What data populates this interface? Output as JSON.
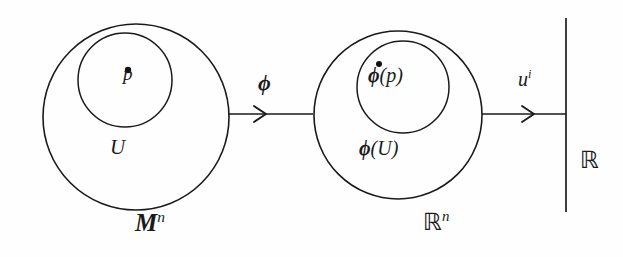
{
  "diagram": {
    "background_color": "#fefefe",
    "stroke_color": "#1a1a1a",
    "labels": {
      "point_p": "p",
      "neighborhood_U": "U",
      "manifold_M": "M",
      "manifold_M_superscript": "n",
      "chart_map_phi": "ϕ",
      "image_point": "ϕ(p)",
      "image_point_phi": "ϕ",
      "image_point_arg": "(p)",
      "image_set": "ϕ(U)",
      "image_set_phi": "ϕ",
      "image_set_arg": "(U)",
      "euclidean_Rn": "ℝ",
      "euclidean_Rn_superscript": "n",
      "coordinate_function_u": "u",
      "coordinate_function_superscript": "i",
      "real_line_R": "ℝ"
    },
    "shapes": {
      "left_outer_circle": {
        "cx": 136,
        "cy": 117,
        "r": 93
      },
      "left_inner_circle": {
        "cx": 125,
        "cy": 80,
        "r": 47
      },
      "right_outer_circle": {
        "cx": 398,
        "cy": 115,
        "r": 84
      },
      "right_inner_circle": {
        "cx": 403,
        "cy": 87,
        "r": 46
      },
      "point_p_dot": {
        "cx": 128,
        "cy": 70,
        "r": 3.2
      },
      "image_point_dot": {
        "cx": 379,
        "cy": 64,
        "r": 3.0
      },
      "phi_arrow": {
        "x1": 228,
        "y1": 114,
        "x2": 313,
        "y2": 114,
        "head_x": 262
      },
      "u_arrow": {
        "x1": 482,
        "y1": 114,
        "x2": 566,
        "y2": 114,
        "head_x": 530
      },
      "real_line": {
        "x": 566,
        "y1": 18,
        "y2": 212
      }
    }
  }
}
